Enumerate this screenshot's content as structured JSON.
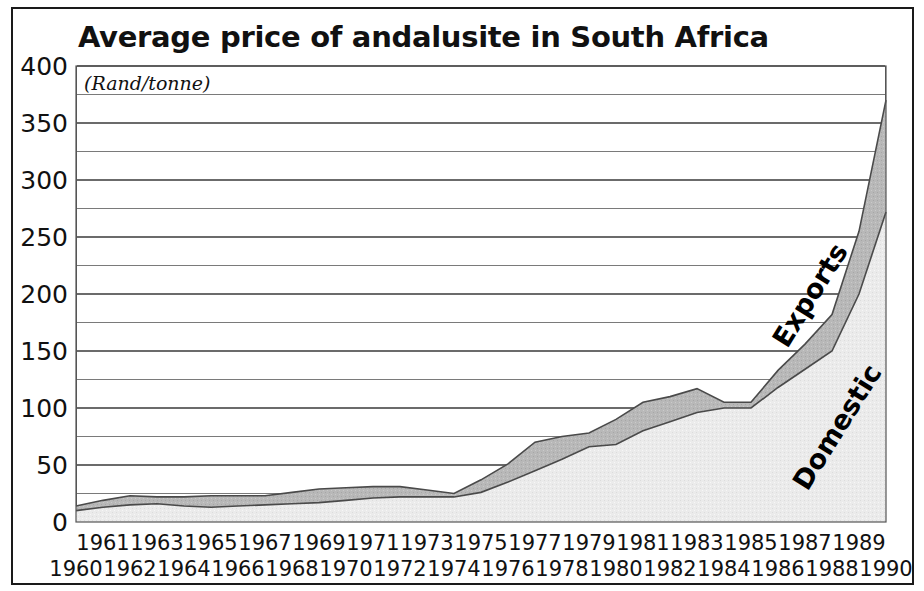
{
  "chart_data": {
    "type": "area",
    "stacked": true,
    "title": "Average price of andalusite in South Africa",
    "subtitle": "(Rand/tonne)",
    "xlabel": "",
    "ylabel": "",
    "units": "Rand/tonne",
    "ylim": [
      0,
      400
    ],
    "ytick_labels": [
      "400",
      "350",
      "300",
      "250",
      "200",
      "150",
      "100",
      "50",
      "0"
    ],
    "ytick_values": [
      400,
      350,
      300,
      250,
      200,
      150,
      100,
      50,
      0
    ],
    "ygrid_minor_step": 25,
    "grid": true,
    "legend_position": "inline-annotations",
    "categories": [
      1960,
      1961,
      1962,
      1963,
      1964,
      1965,
      1966,
      1967,
      1968,
      1969,
      1970,
      1971,
      1972,
      1973,
      1974,
      1975,
      1976,
      1977,
      1978,
      1979,
      1980,
      1981,
      1982,
      1983,
      1984,
      1985,
      1986,
      1987,
      1988,
      1989,
      1990
    ],
    "xtick_labels_top_row": [
      "1961",
      "1963",
      "1965",
      "1967",
      "1969",
      "1971",
      "1973",
      "1975",
      "1977",
      "1979",
      "1981",
      "1983",
      "1985",
      "1987",
      "1989"
    ],
    "xtick_labels_bottom_row": [
      "1960",
      "1962",
      "1964",
      "1966",
      "1968",
      "1970",
      "1972",
      "1974",
      "1976",
      "1978",
      "1980",
      "1982",
      "1984",
      "1986",
      "1988",
      "1990"
    ],
    "series": [
      {
        "name": "Domestic",
        "color": "#ebebeb",
        "values": [
          10,
          13,
          15,
          16,
          14,
          13,
          14,
          15,
          16,
          17,
          19,
          21,
          22,
          22,
          22,
          26,
          35,
          45,
          55,
          66,
          68,
          80,
          88,
          96,
          100,
          100,
          118,
          134,
          150,
          200,
          272
        ]
      },
      {
        "name": "Exports",
        "color": "#b8b8b8",
        "values": [
          4,
          6,
          8,
          6,
          8,
          10,
          9,
          8,
          10,
          12,
          11,
          10,
          9,
          6,
          3,
          11,
          16,
          25,
          20,
          12,
          22,
          25,
          22,
          21,
          5,
          5,
          15,
          22,
          32,
          55,
          98
        ]
      }
    ],
    "totals": [
      14,
      19,
      23,
      22,
      22,
      23,
      23,
      23,
      26,
      29,
      30,
      31,
      31,
      28,
      25,
      37,
      51,
      70,
      75,
      78,
      90,
      105,
      110,
      117,
      105,
      105,
      133,
      156,
      182,
      255,
      370
    ],
    "annotations": [
      {
        "text": "Exports",
        "series": "Exports"
      },
      {
        "text": "Domestic",
        "series": "Domestic"
      }
    ]
  },
  "colors": {
    "domestic_fill": "#ebebeb",
    "exports_fill": "#b8b8b8",
    "line": "#4a4a4a",
    "frame": "#1a1a1a",
    "grid": "#6b6b6b",
    "text": "#111111",
    "background": "#ffffff"
  }
}
